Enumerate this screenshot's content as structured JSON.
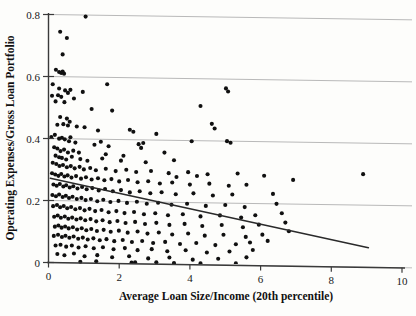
{
  "chart_data": {
    "type": "scatter",
    "title": "",
    "xlabel": "Average Loan Size/Income (20th percentile)",
    "ylabel": "Operating Expenses/Gross Loan Portfolio",
    "xlim": [
      0,
      10
    ],
    "ylim": [
      0,
      0.8
    ],
    "xticks": [
      0,
      2,
      4,
      6,
      8,
      10
    ],
    "yticks": [
      0,
      0.2,
      0.4,
      0.6,
      0.8
    ],
    "xtick_labels": [
      "0",
      "2",
      "4",
      "6",
      "8",
      "10"
    ],
    "ytick_labels": [
      "0",
      "0.2",
      "0.4",
      "0.6",
      "0.8"
    ],
    "grid": "horizontal",
    "legend": "none",
    "marker": "filled-circle",
    "marker_color": "#101010",
    "fit_line": {
      "label": "linear-fit",
      "color": "#2a2a2a",
      "x": [
        0.05,
        9.05
      ],
      "y": [
        0.272,
        0.063
      ]
    },
    "points": [
      [
        1.05,
        0.795
      ],
      [
        0.33,
        0.745
      ],
      [
        0.52,
        0.725
      ],
      [
        0.4,
        0.672
      ],
      [
        0.21,
        0.622
      ],
      [
        0.3,
        0.615
      ],
      [
        0.36,
        0.612
      ],
      [
        0.4,
        0.617
      ],
      [
        0.44,
        0.61
      ],
      [
        0.12,
        0.575
      ],
      [
        0.3,
        0.562
      ],
      [
        0.47,
        0.556
      ],
      [
        0.62,
        0.558
      ],
      [
        0.1,
        0.538
      ],
      [
        0.27,
        0.54
      ],
      [
        0.36,
        0.535
      ],
      [
        0.55,
        0.548
      ],
      [
        0.97,
        0.552
      ],
      [
        1.66,
        0.578
      ],
      [
        5.02,
        0.57
      ],
      [
        5.08,
        0.56
      ],
      [
        0.2,
        0.52
      ],
      [
        0.45,
        0.518
      ],
      [
        0.72,
        0.53
      ],
      [
        4.3,
        0.512
      ],
      [
        1.22,
        0.497
      ],
      [
        1.8,
        0.493
      ],
      [
        0.33,
        0.47
      ],
      [
        0.52,
        0.465
      ],
      [
        0.6,
        0.455
      ],
      [
        0.25,
        0.445
      ],
      [
        0.42,
        0.447
      ],
      [
        0.55,
        0.443
      ],
      [
        0.8,
        0.44
      ],
      [
        1.02,
        0.438
      ],
      [
        4.62,
        0.455
      ],
      [
        4.7,
        0.44
      ],
      [
        1.4,
        0.428
      ],
      [
        2.3,
        0.432
      ],
      [
        2.4,
        0.426
      ],
      [
        3.05,
        0.42
      ],
      [
        0.08,
        0.405
      ],
      [
        0.18,
        0.412
      ],
      [
        0.3,
        0.4
      ],
      [
        0.38,
        0.403
      ],
      [
        0.46,
        0.398
      ],
      [
        0.62,
        0.405
      ],
      [
        4.05,
        0.398
      ],
      [
        5.05,
        0.4
      ],
      [
        5.15,
        0.395
      ],
      [
        1.3,
        0.382
      ],
      [
        1.7,
        0.378
      ],
      [
        2.55,
        0.386
      ],
      [
        2.62,
        0.374
      ],
      [
        0.16,
        0.372
      ],
      [
        0.25,
        0.368
      ],
      [
        0.34,
        0.36
      ],
      [
        0.44,
        0.365
      ],
      [
        0.55,
        0.356
      ],
      [
        3.28,
        0.36
      ],
      [
        0.2,
        0.345
      ],
      [
        0.3,
        0.34
      ],
      [
        0.38,
        0.338
      ],
      [
        0.5,
        0.333
      ],
      [
        0.66,
        0.342
      ],
      [
        0.9,
        0.335
      ],
      [
        1.1,
        0.33
      ],
      [
        1.52,
        0.338
      ],
      [
        2.05,
        0.332
      ],
      [
        2.75,
        0.328
      ],
      [
        3.55,
        0.336
      ],
      [
        8.9,
        0.3
      ],
      [
        0.12,
        0.322
      ],
      [
        0.22,
        0.318
      ],
      [
        0.31,
        0.312
      ],
      [
        0.41,
        0.315
      ],
      [
        0.52,
        0.308
      ],
      [
        0.63,
        0.312
      ],
      [
        0.74,
        0.305
      ],
      [
        0.88,
        0.31
      ],
      [
        1.0,
        0.302
      ],
      [
        1.18,
        0.307
      ],
      [
        1.34,
        0.3
      ],
      [
        1.62,
        0.305
      ],
      [
        1.9,
        0.298
      ],
      [
        2.2,
        0.303
      ],
      [
        2.48,
        0.296
      ],
      [
        2.9,
        0.3
      ],
      [
        3.4,
        0.294
      ],
      [
        3.95,
        0.298
      ],
      [
        4.5,
        0.292
      ],
      [
        5.35,
        0.296
      ],
      [
        0.1,
        0.288
      ],
      [
        0.19,
        0.284
      ],
      [
        0.28,
        0.28
      ],
      [
        0.36,
        0.286
      ],
      [
        0.45,
        0.278
      ],
      [
        0.54,
        0.282
      ],
      [
        0.65,
        0.275
      ],
      [
        0.78,
        0.28
      ],
      [
        0.92,
        0.272
      ],
      [
        1.06,
        0.277
      ],
      [
        1.22,
        0.27
      ],
      [
        1.4,
        0.274
      ],
      [
        1.58,
        0.268
      ],
      [
        1.78,
        0.272
      ],
      [
        2.0,
        0.265
      ],
      [
        2.25,
        0.27
      ],
      [
        2.52,
        0.263
      ],
      [
        2.82,
        0.267
      ],
      [
        3.15,
        0.26
      ],
      [
        3.5,
        0.264
      ],
      [
        4.0,
        0.258
      ],
      [
        4.55,
        0.262
      ],
      [
        5.1,
        0.256
      ],
      [
        5.6,
        0.26
      ],
      [
        0.14,
        0.252
      ],
      [
        0.23,
        0.248
      ],
      [
        0.32,
        0.254
      ],
      [
        0.42,
        0.246
      ],
      [
        0.5,
        0.25
      ],
      [
        0.6,
        0.243
      ],
      [
        0.7,
        0.247
      ],
      [
        0.82,
        0.24
      ],
      [
        0.95,
        0.245
      ],
      [
        1.08,
        0.238
      ],
      [
        1.24,
        0.242
      ],
      [
        1.42,
        0.235
      ],
      [
        1.6,
        0.24
      ],
      [
        1.82,
        0.233
      ],
      [
        2.05,
        0.237
      ],
      [
        2.3,
        0.23
      ],
      [
        2.58,
        0.234
      ],
      [
        2.88,
        0.228
      ],
      [
        3.2,
        0.232
      ],
      [
        3.6,
        0.226
      ],
      [
        4.1,
        0.23
      ],
      [
        4.65,
        0.224
      ],
      [
        5.2,
        0.228
      ],
      [
        6.35,
        0.232
      ],
      [
        0.11,
        0.218
      ],
      [
        0.21,
        0.214
      ],
      [
        0.3,
        0.22
      ],
      [
        0.4,
        0.212
      ],
      [
        0.49,
        0.216
      ],
      [
        0.58,
        0.209
      ],
      [
        0.68,
        0.213
      ],
      [
        0.8,
        0.206
      ],
      [
        0.93,
        0.21
      ],
      [
        1.05,
        0.203
      ],
      [
        1.2,
        0.207
      ],
      [
        1.38,
        0.2
      ],
      [
        1.55,
        0.205
      ],
      [
        1.75,
        0.198
      ],
      [
        1.98,
        0.202
      ],
      [
        2.22,
        0.196
      ],
      [
        2.5,
        0.2
      ],
      [
        2.78,
        0.194
      ],
      [
        3.1,
        0.198
      ],
      [
        3.48,
        0.192
      ],
      [
        3.92,
        0.196
      ],
      [
        4.45,
        0.19
      ],
      [
        5.0,
        0.194
      ],
      [
        5.55,
        0.188
      ],
      [
        6.45,
        0.2
      ],
      [
        0.13,
        0.182
      ],
      [
        0.24,
        0.186
      ],
      [
        0.33,
        0.179
      ],
      [
        0.43,
        0.183
      ],
      [
        0.53,
        0.176
      ],
      [
        0.64,
        0.18
      ],
      [
        0.76,
        0.173
      ],
      [
        0.89,
        0.177
      ],
      [
        1.02,
        0.17
      ],
      [
        1.16,
        0.175
      ],
      [
        1.32,
        0.168
      ],
      [
        1.5,
        0.172
      ],
      [
        1.7,
        0.165
      ],
      [
        1.92,
        0.169
      ],
      [
        2.15,
        0.163
      ],
      [
        2.42,
        0.167
      ],
      [
        2.7,
        0.16
      ],
      [
        3.02,
        0.164
      ],
      [
        3.38,
        0.158
      ],
      [
        3.8,
        0.162
      ],
      [
        4.3,
        0.156
      ],
      [
        4.85,
        0.16
      ],
      [
        5.45,
        0.154
      ],
      [
        5.85,
        0.162
      ],
      [
        6.6,
        0.17
      ],
      [
        0.16,
        0.148
      ],
      [
        0.26,
        0.152
      ],
      [
        0.35,
        0.145
      ],
      [
        0.46,
        0.149
      ],
      [
        0.56,
        0.142
      ],
      [
        0.67,
        0.146
      ],
      [
        0.79,
        0.14
      ],
      [
        0.91,
        0.144
      ],
      [
        1.04,
        0.138
      ],
      [
        1.19,
        0.142
      ],
      [
        1.35,
        0.135
      ],
      [
        1.53,
        0.139
      ],
      [
        1.73,
        0.133
      ],
      [
        1.95,
        0.137
      ],
      [
        2.18,
        0.131
      ],
      [
        2.45,
        0.135
      ],
      [
        2.73,
        0.129
      ],
      [
        3.05,
        0.133
      ],
      [
        3.42,
        0.127
      ],
      [
        3.85,
        0.131
      ],
      [
        4.35,
        0.125
      ],
      [
        4.9,
        0.129
      ],
      [
        5.5,
        0.123
      ],
      [
        5.95,
        0.132
      ],
      [
        6.7,
        0.14
      ],
      [
        0.18,
        0.116
      ],
      [
        0.28,
        0.12
      ],
      [
        0.37,
        0.113
      ],
      [
        0.47,
        0.117
      ],
      [
        0.57,
        0.111
      ],
      [
        0.69,
        0.115
      ],
      [
        0.81,
        0.108
      ],
      [
        0.94,
        0.112
      ],
      [
        1.07,
        0.106
      ],
      [
        1.21,
        0.11
      ],
      [
        1.37,
        0.104
      ],
      [
        1.56,
        0.108
      ],
      [
        1.76,
        0.102
      ],
      [
        1.99,
        0.106
      ],
      [
        2.24,
        0.1
      ],
      [
        2.52,
        0.104
      ],
      [
        2.8,
        0.098
      ],
      [
        3.12,
        0.102
      ],
      [
        3.5,
        0.096
      ],
      [
        3.95,
        0.1
      ],
      [
        4.42,
        0.094
      ],
      [
        4.95,
        0.098
      ],
      [
        5.58,
        0.092
      ],
      [
        6.05,
        0.1
      ],
      [
        6.8,
        0.112
      ],
      [
        0.15,
        0.086
      ],
      [
        0.27,
        0.09
      ],
      [
        0.38,
        0.083
      ],
      [
        0.48,
        0.087
      ],
      [
        0.59,
        0.081
      ],
      [
        0.71,
        0.085
      ],
      [
        0.84,
        0.078
      ],
      [
        0.97,
        0.082
      ],
      [
        1.11,
        0.076
      ],
      [
        1.27,
        0.08
      ],
      [
        1.45,
        0.074
      ],
      [
        1.64,
        0.078
      ],
      [
        1.86,
        0.072
      ],
      [
        2.1,
        0.076
      ],
      [
        2.36,
        0.07
      ],
      [
        2.65,
        0.074
      ],
      [
        2.96,
        0.068
      ],
      [
        3.3,
        0.072
      ],
      [
        3.72,
        0.066
      ],
      [
        4.18,
        0.07
      ],
      [
        4.72,
        0.064
      ],
      [
        5.3,
        0.068
      ],
      [
        5.7,
        0.074
      ],
      [
        6.2,
        0.08
      ],
      [
        0.2,
        0.055
      ],
      [
        0.34,
        0.058
      ],
      [
        0.5,
        0.052
      ],
      [
        0.66,
        0.056
      ],
      [
        0.85,
        0.05
      ],
      [
        1.05,
        0.054
      ],
      [
        1.28,
        0.048
      ],
      [
        1.54,
        0.052
      ],
      [
        1.84,
        0.046
      ],
      [
        2.16,
        0.05
      ],
      [
        2.52,
        0.044
      ],
      [
        2.92,
        0.048
      ],
      [
        3.36,
        0.042
      ],
      [
        3.88,
        0.046
      ],
      [
        4.48,
        0.04
      ],
      [
        5.12,
        0.044
      ],
      [
        5.78,
        0.05
      ],
      [
        0.25,
        0.028
      ],
      [
        0.45,
        0.024
      ],
      [
        0.72,
        0.03
      ],
      [
        1.02,
        0.022
      ],
      [
        1.38,
        0.026
      ],
      [
        1.8,
        0.02
      ],
      [
        2.28,
        0.024
      ],
      [
        2.82,
        0.018
      ],
      [
        3.42,
        0.022
      ],
      [
        4.08,
        0.016
      ],
      [
        4.8,
        0.02
      ],
      [
        5.6,
        0.026
      ],
      [
        0.9,
        0.004
      ],
      [
        1.35,
        0.006
      ],
      [
        2.35,
        0.004
      ],
      [
        2.45,
        0.005
      ],
      [
        3.05,
        0.006
      ],
      [
        3.55,
        0.004
      ],
      [
        4.3,
        0.005
      ],
      [
        5.3,
        0.006
      ],
      [
        1.62,
        0.352
      ],
      [
        2.12,
        0.348
      ],
      [
        0.7,
        0.362
      ],
      [
        0.86,
        0.356
      ],
      [
        3.62,
        0.282
      ],
      [
        4.2,
        0.286
      ],
      [
        6.1,
        0.29
      ],
      [
        6.92,
        0.278
      ],
      [
        0.58,
        0.392
      ],
      [
        0.76,
        0.388
      ],
      [
        1.48,
        0.392
      ],
      [
        2.68,
        0.39
      ]
    ]
  },
  "bleed_text": [
    {
      "t": "of the portfolio and the average loan balance",
      "x": 210,
      "y": 14
    },
    {
      "t": "tends to be smaller in markets where",
      "x": 196,
      "y": 28
    },
    {
      "t": "incomes are lower and outreach is deeper",
      "x": 204,
      "y": 42
    },
    {
      "t": "the relationship is broadly negative",
      "x": 214,
      "y": 56
    },
    {
      "t": "across the sample of institutions",
      "x": 222,
      "y": 70
    },
    {
      "t": "with considerable dispersion at",
      "x": 230,
      "y": 84
    },
    {
      "t": "low loan size ratios",
      "x": 246,
      "y": 98
    },
    {
      "t": "suggesting efficiency gains",
      "x": 236,
      "y": 112
    },
    {
      "t": "as scale increases",
      "x": 252,
      "y": 126
    },
    {
      "t": "though outliers remain",
      "x": 240,
      "y": 140
    },
    {
      "t": "in the upper range",
      "x": 250,
      "y": 154
    },
    {
      "t": "of the distribution",
      "x": 248,
      "y": 168
    }
  ]
}
